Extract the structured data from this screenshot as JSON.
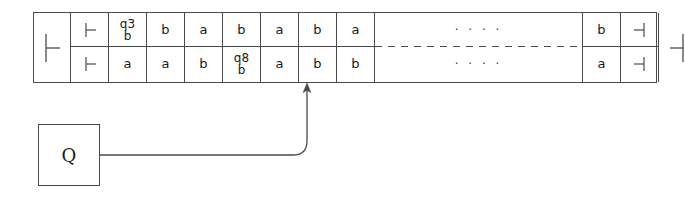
{
  "diagram": {
    "line_color": "#4a4a4a",
    "text_color": "#1a1a1a"
  },
  "tape": {
    "left_end": {
      "name": "left-endmarker",
      "symbol": "⊢"
    },
    "right_end": {
      "name": "right-endmarker",
      "symbol": "⊣"
    },
    "ellipsis": "· · · ·",
    "cells": [
      {
        "upper": "⊢",
        "lower": "⊢",
        "upper_state": "",
        "lower_state": ""
      },
      {
        "upper": "b",
        "lower": "a",
        "upper_state": "q3",
        "lower_state": ""
      },
      {
        "upper": "b",
        "lower": "a",
        "upper_state": "",
        "lower_state": ""
      },
      {
        "upper": "a",
        "lower": "b",
        "upper_state": "",
        "lower_state": ""
      },
      {
        "upper": "b",
        "lower": "b",
        "upper_state": "",
        "lower_state": "q8"
      },
      {
        "upper": "a",
        "lower": "a",
        "upper_state": "",
        "lower_state": ""
      },
      {
        "upper": "b",
        "lower": "b",
        "upper_state": "",
        "lower_state": ""
      },
      {
        "upper": "a",
        "lower": "b",
        "upper_state": "",
        "lower_state": ""
      },
      {
        "upper": "· · · ·",
        "lower": "· · · ·",
        "upper_state": "",
        "lower_state": ""
      },
      {
        "upper": "b",
        "lower": "a",
        "upper_state": "",
        "lower_state": ""
      },
      {
        "upper": "⊣",
        "lower": "⊣",
        "upper_state": "",
        "lower_state": ""
      },
      {
        "upper": "⊣",
        "lower": "⊣",
        "upper_state": "",
        "lower_state": ""
      }
    ]
  },
  "control": {
    "label": "Q",
    "name": "control-unit-box"
  },
  "head_pointer": {
    "name": "tape-head-arrow",
    "points_to_cell_index": 4
  }
}
